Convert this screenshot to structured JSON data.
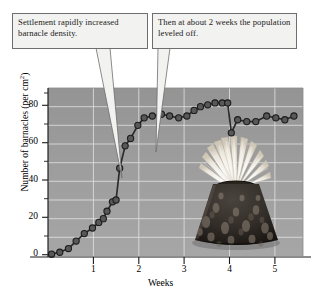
{
  "annotations": [
    {
      "id": "callout-left",
      "text": "Settlement rapidly increased barnacle density."
    },
    {
      "id": "callout-right",
      "text": "Then at about 2 weeks the population leveled off."
    }
  ],
  "axis": {
    "y_ticks": [
      "0",
      "20",
      "40",
      "60",
      "80"
    ],
    "x_ticks": [
      "1",
      "2",
      "3",
      "4",
      "5"
    ],
    "y_label_main": "Number of barnacles (per cm",
    "y_label_sup": "2",
    "y_label_close": ")",
    "x_label": "Weeks"
  },
  "colors": {
    "plot_background": "#9a9a9a",
    "gridline": "#e8e8e8",
    "series_line": "#2b2b2b",
    "marker_fill": "#585858",
    "marker_stroke": "#1c1c1c",
    "callout_fill": "#f2f2f0",
    "callout_border": "#6e6e6e",
    "axis": "#1a1a1a"
  },
  "figure_image": {
    "name": "barnacle-photograph",
    "caption": "Acorn barnacle with extended feeding cirri"
  },
  "chart_data": {
    "type": "line",
    "title": "",
    "xlabel": "Weeks",
    "ylabel": "Number of barnacles (per cm2)",
    "xlim": [
      0,
      5.62
    ],
    "ylim": [
      0,
      90
    ],
    "grid": true,
    "legend": false,
    "markers": true,
    "series": [
      {
        "name": "Barnacle density",
        "points": [
          [
            0.08,
            1
          ],
          [
            0.26,
            2
          ],
          [
            0.45,
            4
          ],
          [
            0.62,
            8
          ],
          [
            0.8,
            12
          ],
          [
            0.98,
            15
          ],
          [
            1.12,
            18
          ],
          [
            1.22,
            20
          ],
          [
            1.3,
            24
          ],
          [
            1.42,
            29
          ],
          [
            1.5,
            30
          ],
          [
            1.58,
            47
          ],
          [
            1.7,
            59
          ],
          [
            1.82,
            63
          ],
          [
            1.98,
            70
          ],
          [
            2.12,
            74
          ],
          [
            2.3,
            75
          ],
          [
            2.5,
            76
          ],
          [
            2.68,
            75
          ],
          [
            2.88,
            74
          ],
          [
            3.06,
            75
          ],
          [
            3.22,
            78
          ],
          [
            3.36,
            80
          ],
          [
            3.52,
            81
          ],
          [
            3.68,
            82
          ],
          [
            3.84,
            82
          ],
          [
            3.96,
            82
          ],
          [
            4.04,
            66
          ],
          [
            4.18,
            73
          ],
          [
            4.38,
            72
          ],
          [
            4.58,
            72
          ],
          [
            4.82,
            75
          ],
          [
            5.02,
            74
          ],
          [
            5.22,
            73
          ],
          [
            5.42,
            75
          ]
        ]
      }
    ]
  }
}
